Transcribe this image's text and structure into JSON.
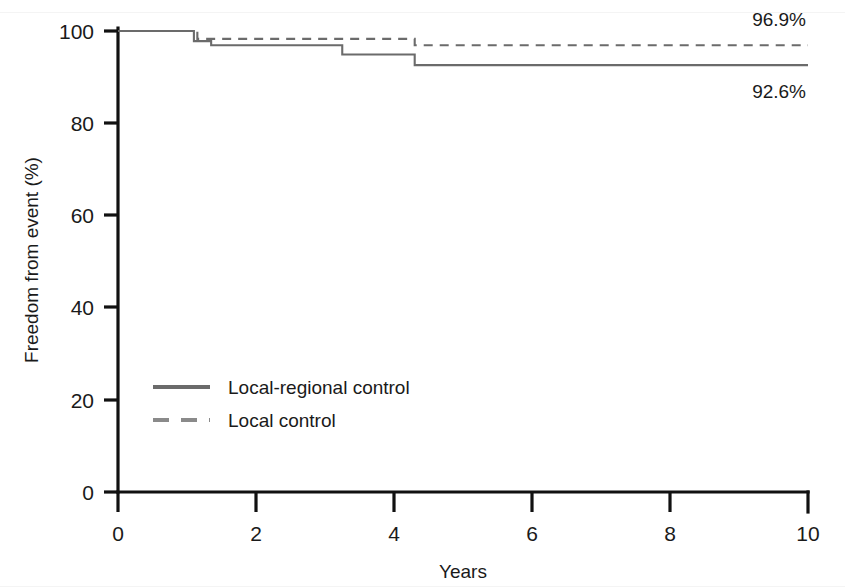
{
  "chart_data": {
    "type": "line",
    "title": "",
    "subtitle": "",
    "xlabel": "Years",
    "ylabel": "Freedom from event (%)",
    "xlim": [
      0,
      10
    ],
    "ylim": [
      0,
      100
    ],
    "xticks": [
      0,
      2,
      4,
      6,
      8,
      10
    ],
    "xtick_labels": [
      "0",
      "2",
      "4",
      "6",
      "8",
      "10"
    ],
    "yticks": [
      0,
      20,
      40,
      60,
      80,
      100
    ],
    "ytick_labels": [
      "0",
      "20",
      "40",
      "60",
      "80",
      "100"
    ],
    "grid": false,
    "legend_position": "center-left",
    "series": [
      {
        "name": "Local-regional control",
        "style": "solid",
        "color": "#6b6b6b",
        "endpoint_label": "92.6%",
        "endpoint_value": 92.6,
        "steps": [
          {
            "x": 0.0,
            "y": 100.0
          },
          {
            "x": 1.1,
            "y": 100.0
          },
          {
            "x": 1.1,
            "y": 97.8
          },
          {
            "x": 1.35,
            "y": 97.8
          },
          {
            "x": 1.35,
            "y": 96.9
          },
          {
            "x": 3.25,
            "y": 96.9
          },
          {
            "x": 3.25,
            "y": 94.9
          },
          {
            "x": 4.3,
            "y": 94.9
          },
          {
            "x": 4.3,
            "y": 92.6
          },
          {
            "x": 10.0,
            "y": 92.6
          }
        ]
      },
      {
        "name": "Local control",
        "style": "dashed",
        "color": "#6b6b6b",
        "endpoint_label": "96.9%",
        "endpoint_value": 96.9,
        "steps": [
          {
            "x": 0.0,
            "y": 100.0
          },
          {
            "x": 1.15,
            "y": 100.0
          },
          {
            "x": 1.15,
            "y": 98.3
          },
          {
            "x": 4.3,
            "y": 98.3
          },
          {
            "x": 4.3,
            "y": 96.9
          },
          {
            "x": 10.0,
            "y": 96.9
          }
        ]
      }
    ],
    "annotations": [
      {
        "text": "96.9%",
        "x": 10.0,
        "y": 96.9,
        "position": "above-right"
      },
      {
        "text": "92.6%",
        "x": 10.0,
        "y": 92.6,
        "position": "below-right"
      }
    ]
  },
  "legend": {
    "items": [
      {
        "label": "Local-regional control",
        "style": "solid"
      },
      {
        "label": "Local control",
        "style": "dashed"
      }
    ]
  },
  "axes": {
    "x_title": "Years",
    "y_title": "Freedom from event (%)"
  }
}
